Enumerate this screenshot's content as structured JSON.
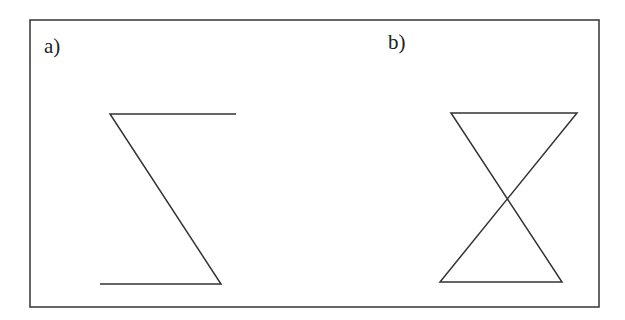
{
  "figure": {
    "panels": [
      {
        "label": "a)",
        "shape": "Z-shaped open path (sigma-like)"
      },
      {
        "label": "b)",
        "shape": "hourglass (crossed triangles)"
      }
    ],
    "colors": {
      "line": "#333333",
      "background": "#ffffff"
    }
  }
}
